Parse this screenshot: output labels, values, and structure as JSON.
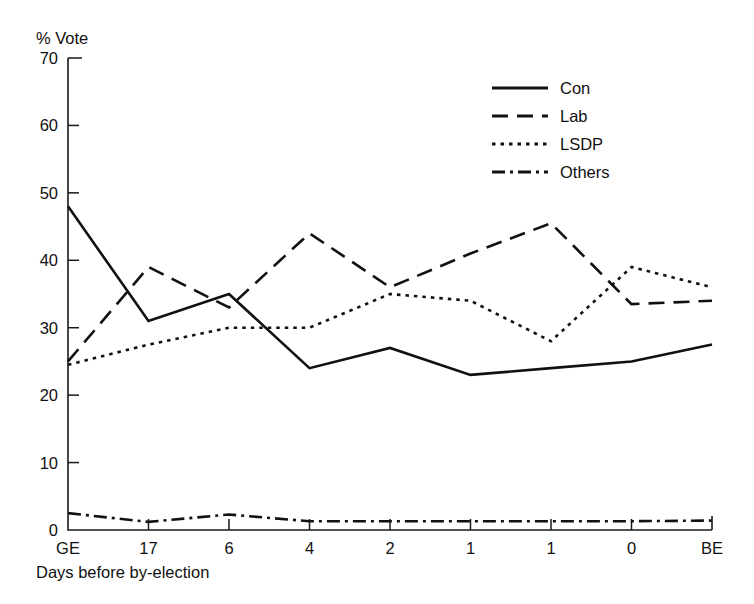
{
  "chart_data": {
    "type": "line",
    "title": "",
    "subtitle": "",
    "xlabel": "Days before by-election",
    "ylabel": "% Vote",
    "categories": [
      "GE",
      "17",
      "6",
      "4",
      "2",
      "1",
      "1",
      "0",
      "BE"
    ],
    "x_tick_labels": [
      "GE",
      "17",
      "6",
      "4",
      "2",
      "1",
      "1",
      "0",
      "BE"
    ],
    "y_tick_labels": [
      "0",
      "10",
      "20",
      "30",
      "40",
      "50",
      "60",
      "70"
    ],
    "y_ticks": [
      0,
      10,
      20,
      30,
      40,
      50,
      60,
      70
    ],
    "ylim": [
      0,
      70
    ],
    "xlim": [
      0,
      8
    ],
    "grid": false,
    "legend_position": "top-right",
    "series": [
      {
        "name": "Con",
        "style": "solid",
        "color": "#111111",
        "values": [
          48,
          31,
          35,
          24,
          27,
          23,
          24,
          25,
          27.5
        ]
      },
      {
        "name": "Lab",
        "style": "dashed",
        "color": "#111111",
        "values": [
          25,
          39,
          33,
          44,
          36,
          41,
          45.5,
          33.5,
          34
        ]
      },
      {
        "name": "LSDP",
        "style": "dotted",
        "color": "#111111",
        "values": [
          24.5,
          27.5,
          30,
          30,
          35,
          34,
          28,
          39,
          36
        ]
      },
      {
        "name": "Others",
        "style": "dash-dot",
        "color": "#111111",
        "values": [
          2.5,
          1.2,
          2.3,
          1.3,
          1.3,
          1.3,
          1.3,
          1.3,
          1.4
        ]
      }
    ],
    "legend": [
      {
        "label": "Con",
        "style": "solid"
      },
      {
        "label": "Lab",
        "style": "dashed"
      },
      {
        "label": "LSDP",
        "style": "dotted"
      },
      {
        "label": "Others",
        "style": "dash-dot"
      }
    ]
  },
  "colors": {
    "background": "#ffffff",
    "ink": "#111111",
    "axis": "#1a1a1a"
  }
}
